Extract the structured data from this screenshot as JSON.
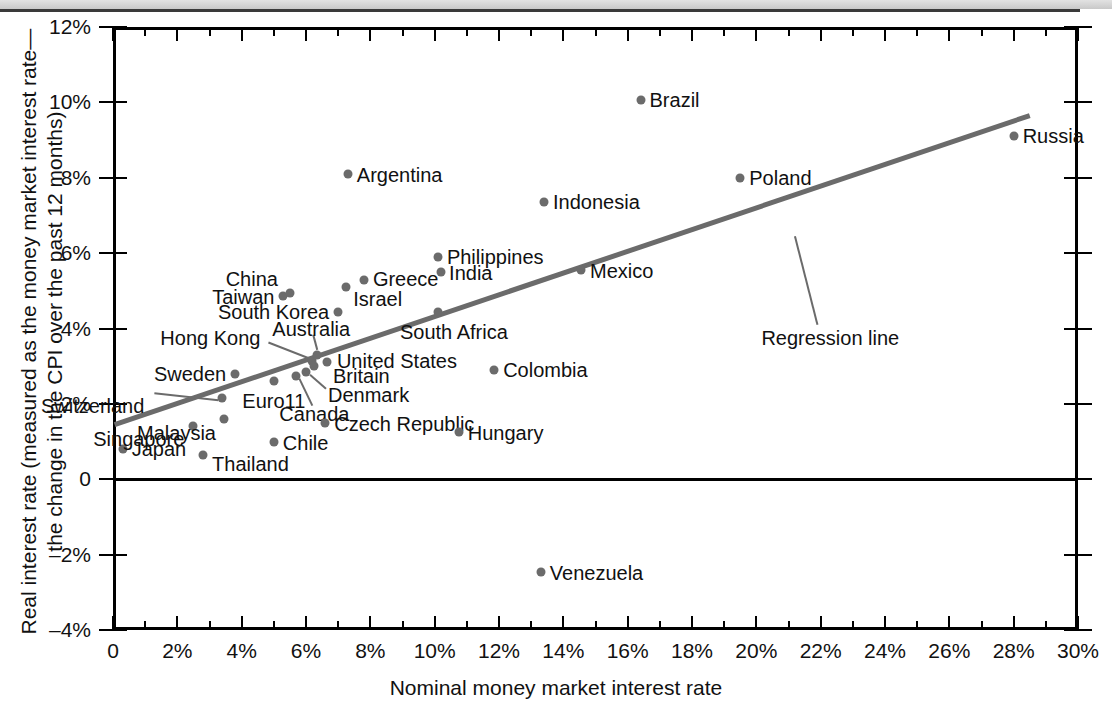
{
  "chart_data": {
    "type": "scatter",
    "title": "",
    "xlabel": "Nominal money market interest rate",
    "ylabel": "Real interest rate (measured as the money market interest rate—the change in the CPI over the past 12 months)",
    "xlim": [
      0,
      30
    ],
    "ylim": [
      -4,
      12
    ],
    "grid": false,
    "legend": null,
    "xticks": [
      "0",
      "2%",
      "4%",
      "6%",
      "8%",
      "10%",
      "12%",
      "14%",
      "16%",
      "18%",
      "20%",
      "22%",
      "24%",
      "26%",
      "28%",
      "30%"
    ],
    "xtick_values": [
      0,
      2,
      4,
      6,
      8,
      10,
      12,
      14,
      16,
      18,
      20,
      22,
      24,
      26,
      28,
      30
    ],
    "yticks": [
      "12%",
      "10%",
      "8%",
      "6%",
      "4%",
      "2%",
      "0",
      "–2%",
      "–4%"
    ],
    "ytick_values": [
      12,
      10,
      8,
      6,
      4,
      2,
      0,
      -2,
      -4
    ],
    "xminor_step": 1,
    "points": [
      {
        "label": "Japan",
        "x": 0.3,
        "y": 0.8,
        "lpos": "l",
        "ldx": 9,
        "ldy": 0
      },
      {
        "label": "Singapore",
        "x": 2.5,
        "y": 1.4,
        "lpos": "r",
        "ldx": -9,
        "ldy": 13
      },
      {
        "label": "Thailand",
        "x": 2.8,
        "y": 0.65,
        "lpos": "l",
        "ldx": 9,
        "ldy": 9
      },
      {
        "label": "Switzerland",
        "x": 3.4,
        "y": 2.15,
        "lpos": "r",
        "ldx": -78,
        "ldy": 8
      },
      {
        "label": "Malaysia",
        "x": 3.45,
        "y": 1.6,
        "lpos": "r",
        "ldx": -8,
        "ldy": 14
      },
      {
        "label": "Sweden",
        "x": 3.8,
        "y": 2.8,
        "lpos": "r",
        "ldx": -9,
        "ldy": 0
      },
      {
        "label": "Euro11",
        "x": 5.0,
        "y": 2.6,
        "lpos": "c",
        "ldx": 0,
        "ldy": 20
      },
      {
        "label": "Chile",
        "x": 5.0,
        "y": 1.0,
        "lpos": "l",
        "ldx": 9,
        "ldy": 1
      },
      {
        "label": "Taiwan",
        "x": 5.3,
        "y": 4.85,
        "lpos": "r",
        "ldx": -9,
        "ldy": 1
      },
      {
        "label": "China",
        "x": 5.5,
        "y": 4.95,
        "lpos": "r",
        "ldx": -12,
        "ldy": -14
      },
      {
        "label": "Canada",
        "x": 5.7,
        "y": 2.75,
        "lpos": "c",
        "ldx": 18,
        "ldy": 38
      },
      {
        "label": "Denmark",
        "x": 6.0,
        "y": 2.85,
        "lpos": "l",
        "ldx": 22,
        "ldy": 23
      },
      {
        "label": "Hong Kong",
        "x": 6.2,
        "y": 3.15,
        "lpos": "r",
        "ldx": -52,
        "ldy": -23
      },
      {
        "label": "Britain",
        "x": 6.25,
        "y": 3.0,
        "lpos": "l",
        "ldx": 19,
        "ldy": 10
      },
      {
        "label": "Australia",
        "x": 6.35,
        "y": 3.3,
        "lpos": "c",
        "ldx": -6,
        "ldy": -26
      },
      {
        "label": "United States",
        "x": 6.65,
        "y": 3.1,
        "lpos": "l",
        "ldx": 10,
        "ldy": -1
      },
      {
        "label": "Czech Republic",
        "x": 6.6,
        "y": 1.5,
        "lpos": "l",
        "ldx": 9,
        "ldy": 1
      },
      {
        "label": "South Korea",
        "x": 7.0,
        "y": 4.45,
        "lpos": "r",
        "ldx": -9,
        "ldy": 0
      },
      {
        "label": "Argentina",
        "x": 7.3,
        "y": 8.1,
        "lpos": "l",
        "ldx": 9,
        "ldy": 1
      },
      {
        "label": "Israel",
        "x": 7.25,
        "y": 5.1,
        "lpos": "l",
        "ldx": 7,
        "ldy": 12
      },
      {
        "label": "Greece",
        "x": 7.8,
        "y": 5.3,
        "lpos": "l",
        "ldx": 9,
        "ldy": -1
      },
      {
        "label": "Philippines",
        "x": 10.1,
        "y": 5.9,
        "lpos": "l",
        "ldx": 9,
        "ldy": 0
      },
      {
        "label": "India",
        "x": 10.2,
        "y": 5.5,
        "lpos": "l",
        "ldx": 8,
        "ldy": 1
      },
      {
        "label": "South Africa",
        "x": 10.1,
        "y": 4.45,
        "lpos": "c",
        "ldx": 16,
        "ldy": 20
      },
      {
        "label": "Hungary",
        "x": 10.75,
        "y": 1.25,
        "lpos": "l",
        "ldx": 9,
        "ldy": 1
      },
      {
        "label": "Colombia",
        "x": 11.85,
        "y": 2.9,
        "lpos": "l",
        "ldx": 9,
        "ldy": 0
      },
      {
        "label": "Venezuela",
        "x": 13.3,
        "y": -2.45,
        "lpos": "l",
        "ldx": 9,
        "ldy": 1
      },
      {
        "label": "Indonesia",
        "x": 13.4,
        "y": 7.35,
        "lpos": "l",
        "ldx": 9,
        "ldy": 0
      },
      {
        "label": "Mexico",
        "x": 14.55,
        "y": 5.55,
        "lpos": "l",
        "ldx": 9,
        "ldy": 1
      },
      {
        "label": "Brazil",
        "x": 16.4,
        "y": 10.05,
        "lpos": "l",
        "ldx": 9,
        "ldy": 0
      },
      {
        "label": "Poland",
        "x": 19.5,
        "y": 8.0,
        "lpos": "l",
        "ldx": 9,
        "ldy": 0
      },
      {
        "label": "Russia",
        "x": 28.0,
        "y": 9.1,
        "lpos": "l",
        "ldx": 9,
        "ldy": 0
      }
    ],
    "regression_line": {
      "label": "Regression line",
      "x_start": 0.05,
      "y_start": 1.45,
      "x_end": 28.5,
      "y_end": 9.65
    },
    "colors": {
      "dot": "#6b6b6b",
      "line": "#6b6b6b",
      "axis": "#000000",
      "text": "#111111",
      "topbar": "#d4d4d4"
    }
  }
}
